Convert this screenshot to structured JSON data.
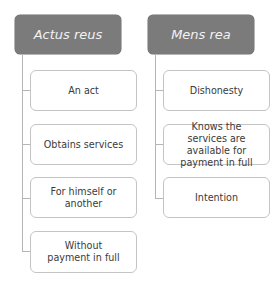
{
  "diagram": {
    "columns": [
      {
        "title": "Actus reus",
        "items": [
          "An act",
          "Obtains services",
          "For himself or another",
          "Without payment in full"
        ]
      },
      {
        "title": "Mens rea",
        "items": [
          "Dishonesty",
          "Knows the services are available for payment in full",
          "Intention"
        ]
      }
    ]
  },
  "colors": {
    "header_fill": "#7b7b7b",
    "header_text": "#f2f2f2",
    "connector": "#b5b5b5",
    "box_border": "#c4c4c4",
    "box_text": "#3a3a3a"
  }
}
